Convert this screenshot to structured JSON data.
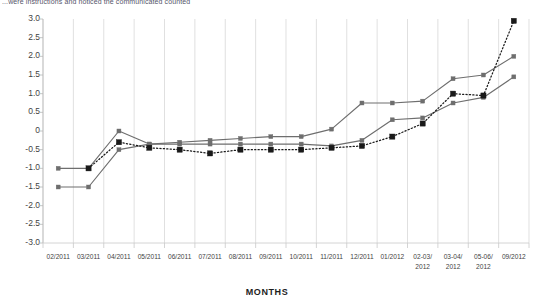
{
  "caption": {
    "text": "...were instructions and noticed the communicated counted"
  },
  "axis_title": {
    "x": "MONTHS"
  },
  "chart_data": {
    "type": "line",
    "title": "",
    "subtitle": "",
    "xlabel": "MONTHS",
    "ylabel": "",
    "ylim": [
      -3.0,
      3.0
    ],
    "ytick_step": 0.5,
    "grid": "vertical",
    "legend_position": "none",
    "categories": [
      "02/2011",
      "03/2011",
      "04/2011",
      "05/2011",
      "06/2011",
      "07/2011",
      "08/2011",
      "09/2011",
      "10/2011",
      "11/2011",
      "12/2011",
      "01/2012",
      "02-03/\n2012",
      "03-04/\n2012",
      "05-06/\n2012",
      "09/2012"
    ],
    "ytick_labels": [
      "3.0",
      "2.5",
      "2.0",
      "1.5",
      "1.0",
      "0.5",
      "0",
      "-0.5",
      "-1.0",
      "-1.5",
      "-2.0",
      "-2.5",
      "-3.0"
    ],
    "ytick_values": [
      3.0,
      2.5,
      2.0,
      1.5,
      1.0,
      0.5,
      0,
      -0.5,
      -1.0,
      -1.5,
      -2.0,
      -2.5,
      -3.0
    ],
    "series": [
      {
        "name": "Series 1",
        "style": "solid",
        "color": "#6e6e6e",
        "marker": "square",
        "values": [
          -1.0,
          -1.0,
          0.0,
          -0.35,
          -0.3,
          -0.25,
          -0.2,
          -0.15,
          -0.15,
          0.05,
          0.75,
          0.75,
          0.8,
          1.4,
          1.5,
          2.0
        ]
      },
      {
        "name": "Series 2",
        "style": "solid",
        "color": "#6e6e6e",
        "marker": "square",
        "values": [
          -1.5,
          -1.5,
          -0.5,
          -0.35,
          -0.35,
          -0.35,
          -0.35,
          -0.35,
          -0.35,
          -0.4,
          -0.25,
          0.3,
          0.35,
          0.75,
          0.9,
          1.45
        ]
      },
      {
        "name": "Series 3",
        "style": "dotted",
        "color": "#1a1a1a",
        "marker": "square",
        "values": [
          null,
          -1.0,
          -0.3,
          -0.45,
          -0.5,
          -0.6,
          -0.5,
          -0.5,
          -0.5,
          -0.45,
          -0.4,
          -0.15,
          0.2,
          1.0,
          0.95,
          2.95
        ]
      }
    ]
  }
}
